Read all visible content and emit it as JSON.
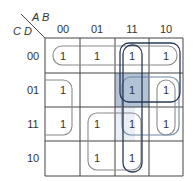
{
  "variables": {
    "row_vars": "C D",
    "col_vars": "A B"
  },
  "col_headers": [
    "00",
    "01",
    "11",
    "10"
  ],
  "row_headers": [
    "00",
    "01",
    "11",
    "10"
  ],
  "cells": [
    [
      "1",
      "1",
      "1",
      "1"
    ],
    [
      "1",
      "",
      "1",
      "1"
    ],
    [
      "1",
      "1",
      "1",
      "1"
    ],
    [
      "",
      "1",
      "1",
      ""
    ]
  ],
  "shaded_cell": {
    "row": 1,
    "col": 2,
    "color": "#9fb4cc"
  },
  "colors": {
    "grid": "#444444",
    "loop_gray": "#8a8a8a",
    "loop_dark": "#2a3a55",
    "loop_blue": "#6f86a6",
    "text": "#333333"
  }
}
